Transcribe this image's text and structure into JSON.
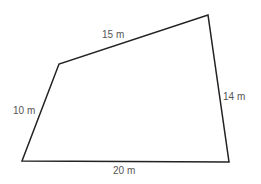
{
  "figure": {
    "shape": "quadrilateral",
    "stroke_color": "#222222",
    "label_color": "#555555",
    "vertices": [
      [
        22,
        161
      ],
      [
        59,
        64
      ],
      [
        208,
        15
      ],
      [
        229,
        162
      ]
    ],
    "sides": [
      {
        "id": "top",
        "label": "15 m"
      },
      {
        "id": "left",
        "label": "10 m"
      },
      {
        "id": "right",
        "label": "14 m"
      },
      {
        "id": "bottom",
        "label": "20 m"
      }
    ]
  }
}
